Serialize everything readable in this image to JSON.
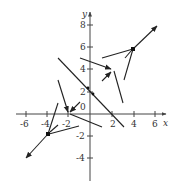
{
  "diagram": {
    "type": "vector-field-plot",
    "axes": {
      "x_label": "x",
      "y_label": "y",
      "x_ticks": [
        "-6",
        "-4",
        "-2",
        "2",
        "4",
        "6"
      ],
      "y_ticks": [
        "8",
        "6",
        "4",
        "2",
        "-2",
        "-4"
      ],
      "origin_label": "0",
      "x_range": [
        -6.5,
        7
      ],
      "y_range": [
        -5.5,
        9
      ]
    },
    "colors": {
      "ink": "#222222",
      "axis": "#444444",
      "background": "#ffffff"
    },
    "points": [
      {
        "x": 4,
        "y": 6
      },
      {
        "x": 2,
        "y": 4
      },
      {
        "x": 0,
        "y": 2
      },
      {
        "x": -2,
        "y": 0
      },
      {
        "x": -4,
        "y": -2
      },
      {
        "x": 2,
        "y": 0
      }
    ]
  }
}
